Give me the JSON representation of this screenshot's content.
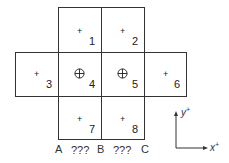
{
  "cells": [
    {
      "id": "1",
      "label": "1",
      "symbol": "plus"
    },
    {
      "id": "2",
      "label": "2",
      "symbol": "plus"
    },
    {
      "id": "3",
      "label": "3",
      "symbol": "plus"
    },
    {
      "id": "4",
      "label": "4",
      "symbol": "circled-plus"
    },
    {
      "id": "5",
      "label": "5",
      "symbol": "circled-plus"
    },
    {
      "id": "6",
      "label": "6",
      "symbol": "plus"
    },
    {
      "id": "7",
      "label": "7",
      "symbol": "plus"
    },
    {
      "id": "8",
      "label": "8",
      "symbol": "plus"
    }
  ],
  "bottom_labels": {
    "a": "A",
    "gap1": "???",
    "b": "B",
    "gap2": "???",
    "c": "C"
  },
  "axes": {
    "y_label": "y",
    "y_sup": "+",
    "x_label": "x",
    "x_sup": "+"
  },
  "symbols": {
    "plus": "+"
  }
}
